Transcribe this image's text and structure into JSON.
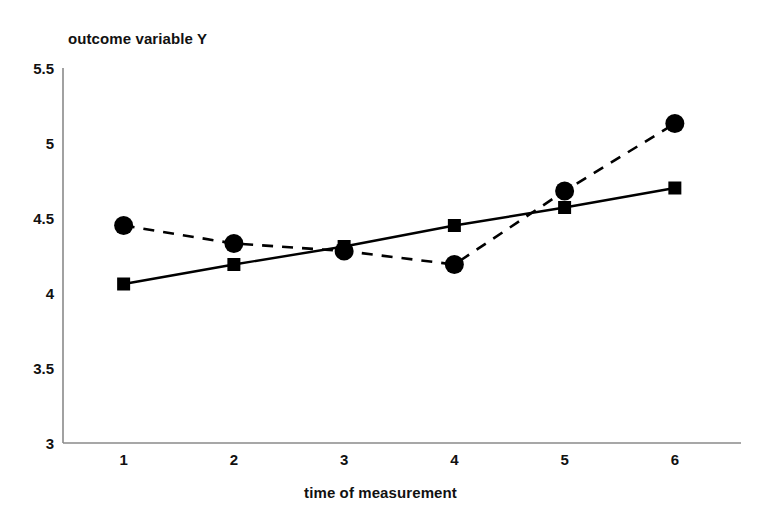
{
  "chart_data": {
    "type": "line",
    "title": "outcome variable Y",
    "xlabel": "time of measurement",
    "ylabel": "outcome variable Y",
    "x": [
      1,
      2,
      3,
      4,
      5,
      6
    ],
    "categories": [
      "1",
      "2",
      "3",
      "4",
      "5",
      "6"
    ],
    "xlim": [
      0.45,
      6.6
    ],
    "ylim": [
      3,
      5.5
    ],
    "yticks": [
      3,
      3.5,
      4,
      4.5,
      5,
      5.5
    ],
    "ytick_labels": [
      "3",
      "3.5",
      "4",
      "4.5",
      "5",
      "5.5"
    ],
    "xticks": [
      1,
      2,
      3,
      4,
      5,
      6
    ],
    "xtick_labels": [
      "1",
      "2",
      "3",
      "4",
      "5",
      "6"
    ],
    "grid": false,
    "legend": "none",
    "series": [
      {
        "name": "dashed-circle-series",
        "marker": "circle",
        "linestyle": "dashed",
        "color": "#000000",
        "values": [
          4.45,
          4.33,
          4.28,
          4.19,
          4.68,
          5.13
        ]
      },
      {
        "name": "solid-square-series",
        "marker": "square",
        "linestyle": "solid",
        "color": "#000000",
        "values": [
          4.06,
          4.19,
          4.31,
          4.45,
          4.57,
          4.7
        ]
      }
    ]
  },
  "axis": {
    "line_color": "#808080",
    "tick_font_weight": "bold"
  }
}
